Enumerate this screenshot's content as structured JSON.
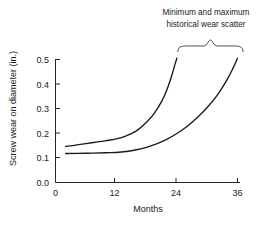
{
  "chart_data": {
    "type": "line",
    "title": "",
    "xlabel": "Months",
    "ylabel": "Screw wear on diameter (in.)",
    "xlim": [
      0,
      38
    ],
    "ylim": [
      0.0,
      0.52
    ],
    "xticks": [
      0,
      12,
      24,
      36
    ],
    "xtick_labels": [
      "0",
      "12",
      "24",
      "36"
    ],
    "yticks": [
      0.0,
      0.1,
      0.2,
      0.3,
      0.4,
      0.5
    ],
    "ytick_labels": [
      "0.0",
      "0.1",
      "0.2",
      "0.3",
      "0.4",
      "0.5"
    ],
    "grid": false,
    "legend": null,
    "annotations": [
      {
        "name": "scatter-brace-annotation",
        "line1": "Minimum and maximum",
        "line2": "historical wear scatter",
        "brace_x_range": [
          24.2,
          37.1
        ],
        "brace_y": 0.555
      }
    ],
    "series": [
      {
        "name": "maximum historical wear",
        "color": "#1a1a1a",
        "x": [
          2.0,
          4.0,
          6.0,
          8.0,
          10.0,
          12.0,
          14.0,
          16.0,
          18.0,
          19.5,
          21.0,
          22.0,
          23.0,
          23.6,
          24.0
        ],
        "y": [
          0.147,
          0.152,
          0.158,
          0.164,
          0.17,
          0.177,
          0.19,
          0.21,
          0.245,
          0.28,
          0.33,
          0.375,
          0.435,
          0.478,
          0.505
        ]
      },
      {
        "name": "minimum historical wear",
        "color": "#1a1a1a",
        "x": [
          2.0,
          6.0,
          10.0,
          12.0,
          14.0,
          16.0,
          18.0,
          20.0,
          22.0,
          24.0,
          26.0,
          28.0,
          30.0,
          32.0,
          34.0,
          35.2,
          36.0
        ],
        "y": [
          0.118,
          0.119,
          0.121,
          0.122,
          0.126,
          0.133,
          0.143,
          0.157,
          0.175,
          0.199,
          0.228,
          0.263,
          0.305,
          0.355,
          0.42,
          0.468,
          0.505
        ]
      }
    ]
  }
}
